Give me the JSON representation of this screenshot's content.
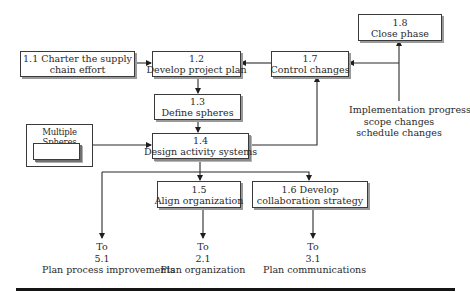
{
  "diagram": {
    "nodes": {
      "n1_1": {
        "id": "1.1",
        "line1": "1.1 Charter the supply",
        "line2": "chain effort"
      },
      "n1_2": {
        "id": "1.2",
        "line1": "1.2",
        "line2": "Develop project plan"
      },
      "n1_3": {
        "id": "1.3",
        "line1": "1.3",
        "line2": "Define spheres"
      },
      "n1_4": {
        "id": "1.4",
        "line1": "1.4",
        "line2": "Design activity systems"
      },
      "n1_5": {
        "id": "1.5",
        "line1": "1.5",
        "line2": "Align organization"
      },
      "n1_6": {
        "id": "1.6",
        "line1": "1.6 Develop",
        "line2": "collaboration strategy"
      },
      "n1_7": {
        "id": "1.7",
        "line1": "1.7",
        "line2": "Control changes"
      },
      "n1_8": {
        "id": "1.8",
        "line1": "1.8",
        "line2": "Close phase"
      }
    },
    "multiple_spheres": {
      "title": "Multiple Spheres"
    },
    "inputs": {
      "changes": {
        "line1": "Implementation progress",
        "line2": "scope changes",
        "line3": "schedule changes"
      }
    },
    "outputs": {
      "to5_1": {
        "line1": "To",
        "line2": "5.1",
        "line3": "Plan process improvements"
      },
      "to2_1": {
        "line1": "To",
        "line2": "2.1",
        "line3": "Plan organization"
      },
      "to3_1": {
        "line1": "To",
        "line2": "3.1",
        "line3": "Plan communications"
      }
    },
    "edges": [
      {
        "from": "1.1",
        "to": "1.2"
      },
      {
        "from": "1.2",
        "to": "1.3"
      },
      {
        "from": "1.3",
        "to": "1.4"
      },
      {
        "from": "Multiple Spheres",
        "to": "1.4"
      },
      {
        "from": "1.4",
        "to": "1.5"
      },
      {
        "from": "1.4",
        "to": "1.6"
      },
      {
        "from": "1.4",
        "to": "5.1"
      },
      {
        "from": "1.4",
        "to": "1.7"
      },
      {
        "from": "1.7",
        "to": "1.2"
      },
      {
        "from": "changes",
        "to": "1.7"
      },
      {
        "from": "changes",
        "to": "1.8"
      },
      {
        "from": "1.5",
        "to": "2.1"
      },
      {
        "from": "1.6",
        "to": "3.1"
      }
    ],
    "colors": {
      "line": "#2a2a2a",
      "shadow": "#9a9a9a",
      "rule": "#151515"
    }
  }
}
